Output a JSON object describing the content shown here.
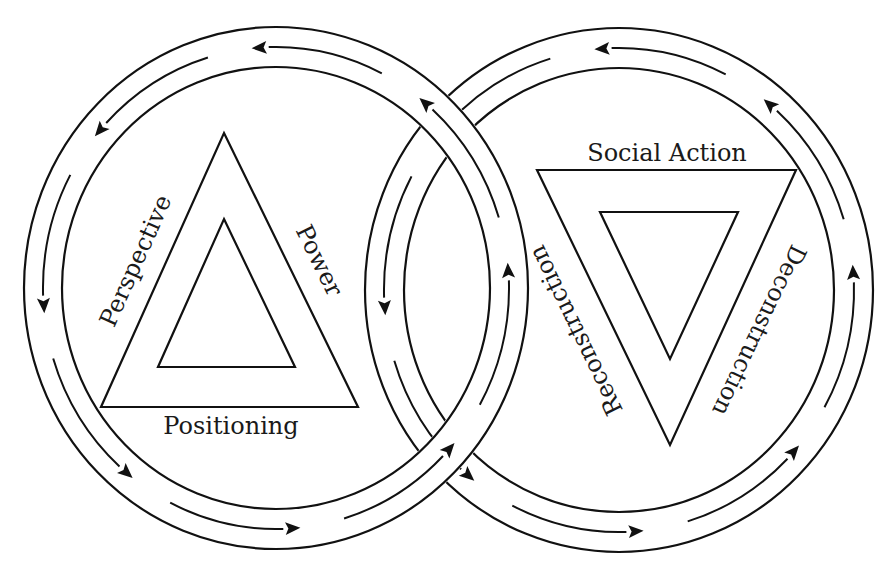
{
  "figure": {
    "type": "two interlocking cycle diagram",
    "background": "#ffffff",
    "stroke_color": "#111111"
  },
  "left_cycle": {
    "name": "left-cycle",
    "center": [
      276,
      288
    ],
    "outer_radius": [
      252,
      261
    ],
    "track_radius": [
      233,
      241
    ],
    "inner_radius": [
      214,
      221
    ],
    "flow_direction": "counter-clockwise",
    "arrow_tip_angles_deg": [
      -96,
      -141,
      174,
      128,
      84,
      40,
      -6,
      -52
    ],
    "triangle": {
      "orientation": "upward",
      "outer": [
        [
          224,
          133
        ],
        [
          358,
          407
        ],
        [
          101,
          407
        ]
      ],
      "inner": [
        [
          224,
          219
        ],
        [
          295,
          367
        ],
        [
          158,
          367
        ]
      ],
      "labels": {
        "left_edge": "Perspective",
        "right_edge": "Power",
        "bottom_edge": "Positioning"
      }
    }
  },
  "right_cycle": {
    "name": "right-cycle",
    "center": [
      619,
      290
    ],
    "outer_radius": [
      254,
      262
    ],
    "track_radius": [
      235,
      242
    ],
    "inner_radius": [
      215,
      222
    ],
    "flow_direction": "counter-clockwise",
    "arrow_tip_angles_deg": [
      -96,
      -141,
      174,
      128,
      84,
      40,
      -6,
      -52
    ],
    "triangle": {
      "orientation": "inverted",
      "outer": [
        [
          537,
          170
        ],
        [
          796,
          170
        ],
        [
          670,
          445
        ]
      ],
      "inner": [
        [
          600,
          212
        ],
        [
          738,
          212
        ],
        [
          670,
          359
        ]
      ],
      "labels": {
        "top_edge": "Social Action",
        "left_edge": "Reconstruction",
        "right_edge": "Deconstruction"
      }
    }
  },
  "label_positions": {
    "Perspective": {
      "x": 143,
      "y": 264,
      "angle": -65.8
    },
    "Power": {
      "x": 312,
      "y": 264,
      "angle": 63.9
    },
    "Positioning": {
      "x": 231,
      "y": 434,
      "angle": 0
    },
    "Social Action": {
      "x": 667,
      "y": 161,
      "angle": 0
    },
    "Reconstruction": {
      "x": 583,
      "y": 327,
      "angle": -115.8
    },
    "Deconstruction": {
      "x": 752,
      "y": 327,
      "angle": 115.6
    }
  }
}
